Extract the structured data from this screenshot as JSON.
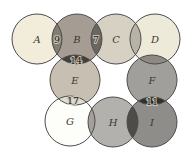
{
  "figure": {
    "type": "venn-grid-diagram",
    "background": "#ffffff",
    "stroke_color": "#4c4c4c",
    "letter_color": "#3b3935",
    "number_color": "#14120e",
    "number_halo_color": "#c8c5ba",
    "circles": [
      {
        "id": "A",
        "label": "A",
        "cx": 37,
        "cy": 39,
        "r": 25,
        "fill": "#f1edda"
      },
      {
        "id": "B",
        "label": "B",
        "cx": 77,
        "cy": 39,
        "r": 25,
        "fill": "#a59d94"
      },
      {
        "id": "C",
        "label": "C",
        "cx": 116,
        "cy": 39,
        "r": 25,
        "fill": "#d7d1c4"
      },
      {
        "id": "D",
        "label": "D",
        "cx": 155,
        "cy": 39,
        "r": 25,
        "fill": "#eeead9"
      },
      {
        "id": "E",
        "label": "E",
        "cx": 75,
        "cy": 80,
        "r": 25,
        "fill": "#c6bfb2"
      },
      {
        "id": "F",
        "label": "F",
        "cx": 152,
        "cy": 80,
        "r": 25,
        "fill": "#a09f9b"
      },
      {
        "id": "G",
        "label": "G",
        "cx": 70,
        "cy": 121,
        "r": 25,
        "fill": "#fdfdfa"
      },
      {
        "id": "H",
        "label": "H",
        "cx": 113,
        "cy": 122,
        "r": 25,
        "fill": "#b2b1ad"
      },
      {
        "id": "I",
        "label": "I",
        "cx": 152,
        "cy": 122,
        "r": 25,
        "fill": "#8e8d89"
      }
    ],
    "overlaps": [
      {
        "a": "A",
        "b": "B",
        "fill": "#847e70",
        "value": "9",
        "label_x": 57,
        "label_y": 39
      },
      {
        "a": "B",
        "b": "C",
        "fill": "#6b665e",
        "value": "7",
        "label_x": 96,
        "label_y": 39
      },
      {
        "a": "C",
        "b": "D",
        "fill": "#b9b3a6",
        "value": "",
        "label_x": 0,
        "label_y": 0
      },
      {
        "a": "B",
        "b": "E",
        "fill": "#453f37",
        "value": "14",
        "label_x": 76,
        "label_y": 60
      },
      {
        "a": "D",
        "b": "F",
        "fill": "#8e8981",
        "value": "",
        "label_x": 0,
        "label_y": 0
      },
      {
        "a": "E",
        "b": "G",
        "fill": "#e0dcd1",
        "value": "17",
        "label_x": 73,
        "label_y": 100
      },
      {
        "a": "G",
        "b": "H",
        "fill": "#a2a099",
        "value": "",
        "label_x": 0,
        "label_y": 0
      },
      {
        "a": "H",
        "b": "I",
        "fill": "#4e4c47",
        "value": "",
        "label_x": 0,
        "label_y": 0
      },
      {
        "a": "F",
        "b": "I",
        "fill": "#32302b",
        "value": "11",
        "label_x": 152,
        "label_y": 101
      }
    ]
  }
}
